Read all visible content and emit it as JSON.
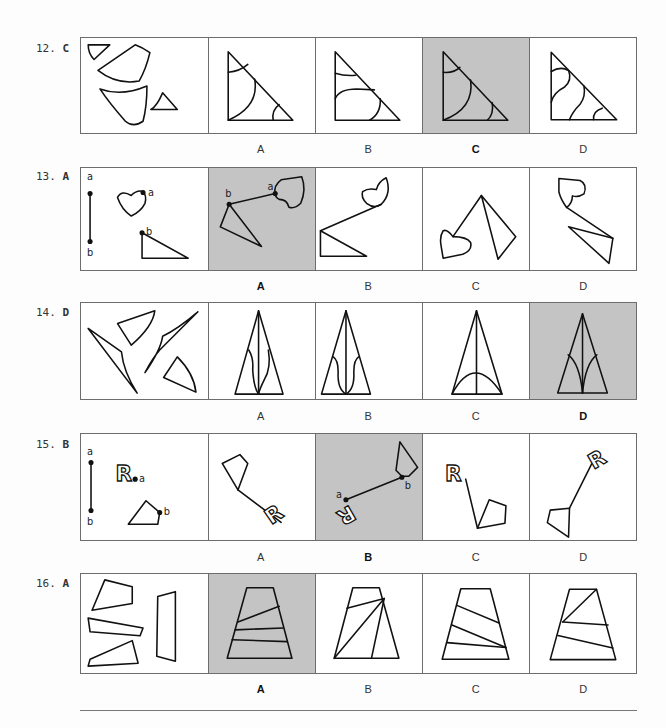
{
  "questions": [
    {
      "number": "12.",
      "answer": "C",
      "selected_index": 2,
      "options": [
        "A",
        "B",
        "C",
        "D"
      ]
    },
    {
      "number": "13.",
      "answer": "A",
      "selected_index": 0,
      "options": [
        "A",
        "B",
        "C",
        "D"
      ],
      "point_labels": {
        "a": "a",
        "b": "b"
      }
    },
    {
      "number": "14.",
      "answer": "D",
      "selected_index": 3,
      "options": [
        "A",
        "B",
        "C",
        "D"
      ]
    },
    {
      "number": "15.",
      "answer": "B",
      "selected_index": 1,
      "options": [
        "A",
        "B",
        "C",
        "D"
      ],
      "point_labels": {
        "a": "a",
        "b": "b"
      },
      "glyph": "R"
    },
    {
      "number": "16.",
      "answer": "A",
      "selected_index": 0,
      "options": [
        "A",
        "B",
        "C",
        "D"
      ]
    }
  ],
  "colors": {
    "selected_bg": "#c4c4c4",
    "border": "#6d6d6d",
    "stroke": "#111111"
  }
}
